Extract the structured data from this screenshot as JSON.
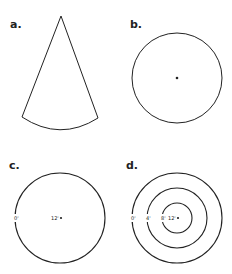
{
  "panels": [
    {
      "id": "a",
      "label": "a.",
      "shape": "cone-sector"
    },
    {
      "id": "b",
      "label": "b.",
      "shape": "circle-with-center-dot"
    },
    {
      "id": "c",
      "label": "c.",
      "shape": "circle-with-tick-labels",
      "ticks": [
        "0'",
        "12'"
      ]
    },
    {
      "id": "d",
      "label": "d.",
      "shape": "concentric-circles",
      "ticks": [
        "0'",
        "4'",
        "8'",
        "12'"
      ]
    }
  ]
}
